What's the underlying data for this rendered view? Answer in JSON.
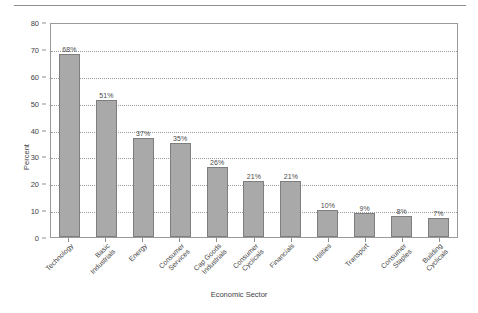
{
  "chart_data": {
    "type": "bar",
    "title": "",
    "xlabel": "Economic Sector",
    "ylabel": "Percent",
    "ylim": [
      0,
      80
    ],
    "ytick_step": 10,
    "yticks": [
      "0",
      "10",
      "20",
      "30",
      "40",
      "50",
      "60",
      "70",
      "80"
    ],
    "grid": "horizontal-dotted",
    "legend": "none",
    "bar_color": "#a9a9a9",
    "bar_edge_color": "#7e7e7e",
    "categories": [
      "Technology",
      "Basic Industrials",
      "Energy",
      "Consumer Services",
      "Cap Goods Industrials",
      "Consumer Cyclicals",
      "Financials",
      "Utilities",
      "Transport",
      "Consumer Staples",
      "Building Cyclicals"
    ],
    "category_lines": [
      [
        "Technology"
      ],
      [
        "Basic",
        "Industrials"
      ],
      [
        "Energy"
      ],
      [
        "Consumer",
        "Services"
      ],
      [
        "Cap Goods",
        "Industrials"
      ],
      [
        "Consumer",
        "Cyclicals"
      ],
      [
        "Financials"
      ],
      [
        "Utilities"
      ],
      [
        "Transport"
      ],
      [
        "Consumer",
        "Staples"
      ],
      [
        "Building",
        "Cyclicals"
      ]
    ],
    "values": [
      68,
      51,
      37,
      35,
      26,
      21,
      21,
      10,
      9,
      8,
      7
    ],
    "data_labels": [
      "68%",
      "51%",
      "37%",
      "35%",
      "26%",
      "21%",
      "21%",
      "10%",
      "9%",
      "8%",
      "7%"
    ]
  }
}
